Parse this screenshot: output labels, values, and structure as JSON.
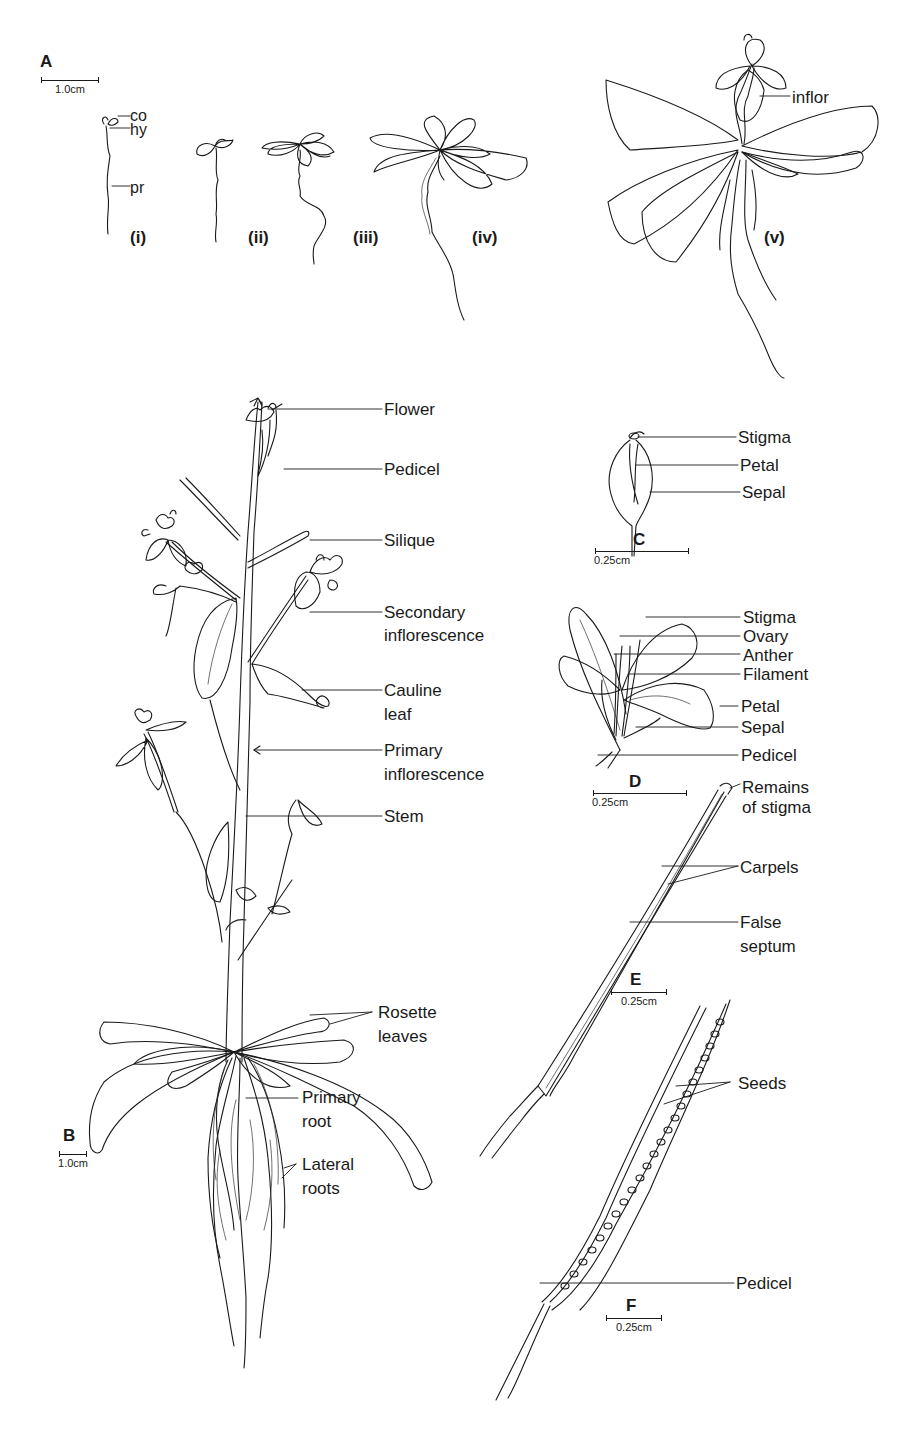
{
  "figure": {
    "colors": {
      "ink": "#1a1a1a",
      "background": "#ffffff"
    }
  },
  "panel_a": {
    "letter": "A",
    "scale_bar": "1.0cm",
    "stages": [
      "(i)",
      "(ii)",
      "(iii)",
      "(iv)",
      "(v)"
    ],
    "seedling_labels": {
      "co": "co",
      "hy": "hy",
      "pr": "pr"
    },
    "inflor_label": "inflor"
  },
  "panel_b": {
    "letter": "B",
    "scale_bar": "1.0cm",
    "labels": {
      "flower": "Flower",
      "pedicel": "Pedicel",
      "silique": "Silique",
      "secondary_inflorescence_1": "Secondary",
      "secondary_inflorescence_2": "inflorescence",
      "cauline_leaf_1": "Cauline",
      "cauline_leaf_2": "leaf",
      "primary_inflorescence_1": "Primary",
      "primary_inflorescence_2": "inflorescence",
      "stem": "Stem",
      "rosette_leaves_1": "Rosette",
      "rosette_leaves_2": "leaves",
      "primary_root_1": "Primary",
      "primary_root_2": "root",
      "lateral_roots_1": "Lateral",
      "lateral_roots_2": "roots"
    }
  },
  "panel_c": {
    "letter": "C",
    "scale_bar": "0.25cm",
    "labels": {
      "stigma": "Stigma",
      "petal": "Petal",
      "sepal": "Sepal"
    }
  },
  "panel_d": {
    "letter": "D",
    "scale_bar": "0.25cm",
    "labels": {
      "stigma": "Stigma",
      "ovary": "Ovary",
      "anther": "Anther",
      "filament": "Filament",
      "petal": "Petal",
      "sepal": "Sepal",
      "pedicel": "Pedicel"
    }
  },
  "panel_e": {
    "letter": "E",
    "scale_bar": "0.25cm",
    "labels": {
      "remains_1": "Remains",
      "remains_2": "of stigma",
      "carpels": "Carpels",
      "false_septum_1": "False",
      "false_septum_2": "septum"
    }
  },
  "panel_f": {
    "letter": "F",
    "scale_bar": "0.25cm",
    "labels": {
      "seeds": "Seeds",
      "pedicel": "Pedicel"
    }
  }
}
